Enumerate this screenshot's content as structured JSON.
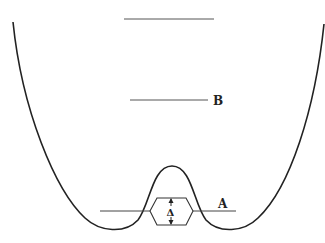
{
  "diagram": {
    "type": "double-well-potential",
    "colors": {
      "stroke": "#222222",
      "level": "#555555",
      "background": "#ffffff"
    },
    "levels": [
      {
        "id": "top",
        "label": "",
        "y": 19,
        "x1": 124,
        "x2": 214
      },
      {
        "id": "B",
        "label": "B",
        "y": 100,
        "x1": 130,
        "x2": 208
      },
      {
        "id": "A",
        "label": "A",
        "y": 211,
        "x1": 100,
        "x2": 236
      }
    ],
    "splitting": {
      "symbol": "Δ",
      "center_x": 171,
      "top_y": 198,
      "bottom_y": 225
    },
    "labels": {
      "B": "B",
      "A": "A",
      "delta": "Δ"
    }
  }
}
